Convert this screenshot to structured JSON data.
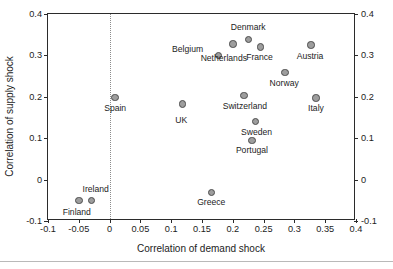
{
  "chart_data": {
    "type": "scatter",
    "title": "",
    "xlabel": "Correlation of demand shock",
    "ylabel": "Correlation of supply shock",
    "xlim": [
      -0.1,
      0.4
    ],
    "ylim": [
      -0.1,
      0.4
    ],
    "xticks": [
      "-0.1",
      "-0.05",
      "0",
      "0.05",
      "0.1",
      "0.15",
      "0.2",
      "0.25",
      "0.3",
      "0.35",
      "0.4"
    ],
    "xtick_values": [
      -0.1,
      -0.05,
      0,
      0.05,
      0.1,
      0.15,
      0.2,
      0.25,
      0.3,
      0.35,
      0.4
    ],
    "yticks": [
      "-0.1",
      "0",
      "0.1",
      "0.2",
      "0.3",
      "0.4"
    ],
    "ytick_values": [
      -0.1,
      0,
      0.1,
      0.2,
      0.3,
      0.4
    ],
    "grid": false,
    "legend": null,
    "right_axis_mirrored": true,
    "reference_lines": [
      {
        "name": "zero-demand-line",
        "axis": "x",
        "value": 0,
        "style": "dotted",
        "color": "#8c8c8c"
      }
    ],
    "marker_style": {
      "shape": "circle",
      "fill": "#9d9d9d",
      "edge": "#4d4d4d",
      "size_px": 7.4
    },
    "points": [
      {
        "label": "Finland",
        "x": -0.05,
        "y": -0.051,
        "label_dx": -2,
        "label_dy": 7
      },
      {
        "label": "Ireland",
        "x": -0.029,
        "y": -0.051,
        "label_dx": 4,
        "label_dy": -16
      },
      {
        "label": "Spain",
        "x": 0.009,
        "y": 0.198,
        "label_dx": 0,
        "label_dy": 6
      },
      {
        "label": "UK",
        "x": 0.118,
        "y": 0.183,
        "label_dx": -1,
        "label_dy": 12
      },
      {
        "label": "Greece",
        "x": 0.165,
        "y": -0.031,
        "label_dx": 0,
        "label_dy": 6
      },
      {
        "label": "Belgium",
        "x": 0.177,
        "y": 0.3,
        "label_dx": -31,
        "label_dy": -10
      },
      {
        "label": "Netherlands",
        "x": 0.2,
        "y": 0.328,
        "label_dx": -9,
        "label_dy": 10
      },
      {
        "label": "Switzerland",
        "x": 0.218,
        "y": 0.203,
        "label_dx": 1,
        "label_dy": 6
      },
      {
        "label": "Denmark",
        "x": 0.225,
        "y": 0.338,
        "label_dx": 0,
        "label_dy": -17
      },
      {
        "label": "Portugal",
        "x": 0.231,
        "y": 0.095,
        "label_dx": 0,
        "label_dy": 6
      },
      {
        "label": "Sweden",
        "x": 0.237,
        "y": 0.14,
        "label_dx": 1,
        "label_dy": 6
      },
      {
        "label": "France",
        "x": 0.245,
        "y": 0.32,
        "label_dx": -1,
        "label_dy": 6
      },
      {
        "label": "Norway",
        "x": 0.285,
        "y": 0.258,
        "label_dx": -1,
        "label_dy": 6
      },
      {
        "label": "Austria",
        "x": 0.327,
        "y": 0.325,
        "label_dx": -1,
        "label_dy": 7
      },
      {
        "label": "Italy",
        "x": 0.335,
        "y": 0.197,
        "label_dx": 0,
        "label_dy": 6
      }
    ]
  }
}
